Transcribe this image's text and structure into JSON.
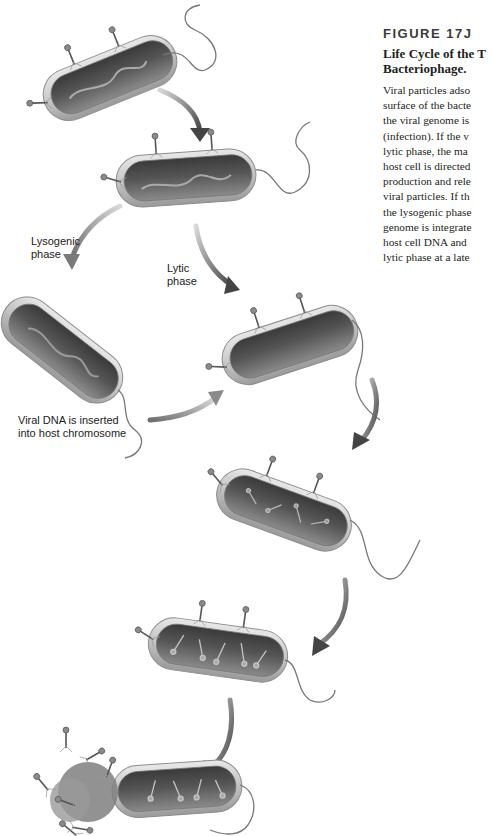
{
  "figure": {
    "number": "FIGURE 17J",
    "title_lines": [
      "Life Cycle of the T",
      "Bacteriophage."
    ],
    "body_lines": [
      "Viral particles adso",
      "surface of the bacte",
      "the viral genome is",
      "(infection). If the v",
      "lytic phase, the ma",
      "host cell is directed",
      "production and rele",
      "viral particles. If th",
      "the lysogenic phase",
      "genome is integrate",
      "host cell DNA and",
      "lytic phase at a late"
    ]
  },
  "labels": {
    "lysogenic": [
      "Lysogenic",
      "phase"
    ],
    "lytic": [
      "Lytic",
      "phase"
    ],
    "inserted": [
      "Viral DNA is inserted",
      "into host chromosome"
    ]
  },
  "stages": [
    {
      "id": "adsorption",
      "description": "Phages attach to bacterial cell surface"
    },
    {
      "id": "injection",
      "description": "Viral genome injected into bacterium"
    },
    {
      "id": "lysogenic",
      "description": "Viral DNA integrated into host chromosome"
    },
    {
      "id": "lytic-start",
      "description": "Lytic phase begins"
    },
    {
      "id": "replication",
      "description": "New viral components produced"
    },
    {
      "id": "assembly",
      "description": "New phage particles assembled"
    },
    {
      "id": "lysis",
      "description": "Cell bursts releasing viral particles"
    }
  ],
  "colors": {
    "cell_outer": "#cfcfcf",
    "cell_inner": "#5a5a5a",
    "arrow": "#555555",
    "text": "#231f20"
  }
}
